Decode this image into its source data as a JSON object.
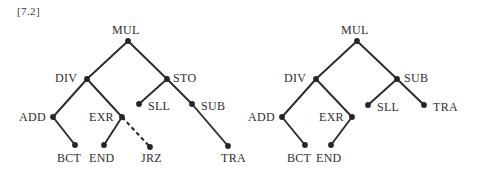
{
  "figure": {
    "label": "[7.2]",
    "width": 480,
    "height": 171,
    "background": "#ffffff",
    "edge_color": "#2b2b2b",
    "node_color": "#262626",
    "text_color": "#2e2e2e"
  },
  "trees": [
    {
      "name": "left-tree",
      "nodes": [
        {
          "id": "L-MUL",
          "label": "MUL",
          "x": 128,
          "y": 41,
          "label_x": 112,
          "label_y": 34,
          "anchor": "start"
        },
        {
          "id": "L-DIV",
          "label": "DIV",
          "x": 87,
          "y": 79,
          "label_x": 55,
          "label_y": 82,
          "anchor": "start"
        },
        {
          "id": "L-STO",
          "label": "STO",
          "x": 167,
          "y": 79,
          "label_x": 173,
          "label_y": 82,
          "anchor": "start"
        },
        {
          "id": "L-ADD",
          "label": "ADD",
          "x": 53,
          "y": 117,
          "label_x": 19,
          "label_y": 121,
          "anchor": "start"
        },
        {
          "id": "L-EXR",
          "label": "EXR",
          "x": 122,
          "y": 117,
          "label_x": 89,
          "label_y": 121,
          "anchor": "start"
        },
        {
          "id": "L-SLL",
          "label": "SLL",
          "x": 139,
          "y": 104,
          "label_x": 148,
          "label_y": 110,
          "anchor": "start"
        },
        {
          "id": "L-SUB",
          "label": "SUB",
          "x": 192,
          "y": 104,
          "label_x": 201,
          "label_y": 110,
          "anchor": "start"
        },
        {
          "id": "L-BCT",
          "label": "BCT",
          "x": 75,
          "y": 145,
          "label_x": 57,
          "label_y": 162,
          "anchor": "start"
        },
        {
          "id": "L-END",
          "label": "END",
          "x": 104,
          "y": 145,
          "label_x": 89,
          "label_y": 162,
          "anchor": "start"
        },
        {
          "id": "L-JRZ",
          "label": "JRZ",
          "x": 150,
          "y": 147,
          "label_x": 141,
          "label_y": 162,
          "anchor": "start"
        },
        {
          "id": "L-TRA",
          "label": "TRA",
          "x": 228,
          "y": 146,
          "label_x": 221,
          "label_y": 162,
          "anchor": "start"
        }
      ],
      "edges": [
        {
          "from": "L-MUL",
          "to": "L-DIV",
          "style": "solid"
        },
        {
          "from": "L-MUL",
          "to": "L-STO",
          "style": "solid"
        },
        {
          "from": "L-DIV",
          "to": "L-ADD",
          "style": "solid"
        },
        {
          "from": "L-DIV",
          "to": "L-EXR",
          "style": "solid"
        },
        {
          "from": "L-STO",
          "to": "L-SLL",
          "style": "solid"
        },
        {
          "from": "L-STO",
          "to": "L-SUB",
          "style": "solid"
        },
        {
          "from": "L-ADD",
          "to": "L-BCT",
          "style": "solid"
        },
        {
          "from": "L-EXR",
          "to": "L-END",
          "style": "solid"
        },
        {
          "from": "L-EXR",
          "to": "L-JRZ",
          "style": "dashed"
        },
        {
          "from": "L-SUB",
          "to": "L-TRA",
          "style": "solid"
        }
      ]
    },
    {
      "name": "right-tree",
      "nodes": [
        {
          "id": "R-MUL",
          "label": "MUL",
          "x": 357,
          "y": 41,
          "label_x": 341,
          "label_y": 34,
          "anchor": "start"
        },
        {
          "id": "R-DIV",
          "label": "DIV",
          "x": 316,
          "y": 79,
          "label_x": 284,
          "label_y": 82,
          "anchor": "start"
        },
        {
          "id": "R-SUB",
          "label": "SUB",
          "x": 397,
          "y": 79,
          "label_x": 404,
          "label_y": 82,
          "anchor": "start"
        },
        {
          "id": "R-ADD",
          "label": "ADD",
          "x": 282,
          "y": 117,
          "label_x": 248,
          "label_y": 121,
          "anchor": "start"
        },
        {
          "id": "R-EXR",
          "label": "EXR",
          "x": 352,
          "y": 117,
          "label_x": 319,
          "label_y": 121,
          "anchor": "start"
        },
        {
          "id": "R-SLL",
          "label": "SLL",
          "x": 368,
          "y": 105,
          "label_x": 377,
          "label_y": 111,
          "anchor": "start"
        },
        {
          "id": "R-TRA",
          "label": "TRA",
          "x": 424,
          "y": 105,
          "label_x": 433,
          "label_y": 111,
          "anchor": "start"
        },
        {
          "id": "R-BCT",
          "label": "BCT",
          "x": 305,
          "y": 145,
          "label_x": 287,
          "label_y": 162,
          "anchor": "start"
        },
        {
          "id": "R-END",
          "label": "END",
          "x": 331,
          "y": 145,
          "label_x": 316,
          "label_y": 162,
          "anchor": "start"
        }
      ],
      "edges": [
        {
          "from": "R-MUL",
          "to": "R-DIV",
          "style": "solid"
        },
        {
          "from": "R-MUL",
          "to": "R-SUB",
          "style": "solid"
        },
        {
          "from": "R-DIV",
          "to": "R-ADD",
          "style": "solid"
        },
        {
          "from": "R-DIV",
          "to": "R-EXR",
          "style": "solid"
        },
        {
          "from": "R-SUB",
          "to": "R-SLL",
          "style": "solid"
        },
        {
          "from": "R-SUB",
          "to": "R-TRA",
          "style": "solid"
        },
        {
          "from": "R-ADD",
          "to": "R-BCT",
          "style": "solid"
        },
        {
          "from": "R-EXR",
          "to": "R-END",
          "style": "solid"
        }
      ]
    }
  ]
}
